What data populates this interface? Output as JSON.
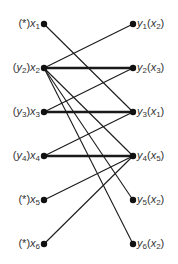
{
  "diagram": {
    "type": "bipartite-matching",
    "left_nodes": [
      {
        "id": "x1",
        "var": "x",
        "sub": "1",
        "label_prefix": "(*)",
        "match": null
      },
      {
        "id": "x2",
        "var": "x",
        "sub": "2",
        "label_prefix": "(y2)",
        "match": "y2"
      },
      {
        "id": "x3",
        "var": "x",
        "sub": "3",
        "label_prefix": "(y3)",
        "match": "y3"
      },
      {
        "id": "x4",
        "var": "x",
        "sub": "4",
        "label_prefix": "(y4)",
        "match": "y4"
      },
      {
        "id": "x5",
        "var": "x",
        "sub": "5",
        "label_prefix": "(*)",
        "match": null
      },
      {
        "id": "x6",
        "var": "x",
        "sub": "6",
        "label_prefix": "(*)",
        "match": null
      }
    ],
    "right_nodes": [
      {
        "id": "y1",
        "var": "y",
        "sub": "1",
        "label_suffix_var": "x",
        "label_suffix_sub": "2"
      },
      {
        "id": "y2",
        "var": "y",
        "sub": "2",
        "label_suffix_var": "x",
        "label_suffix_sub": "3"
      },
      {
        "id": "y3",
        "var": "y",
        "sub": "3",
        "label_suffix_var": "x",
        "label_suffix_sub": "1"
      },
      {
        "id": "y4",
        "var": "y",
        "sub": "4",
        "label_suffix_var": "x",
        "label_suffix_sub": "5"
      },
      {
        "id": "y5",
        "var": "y",
        "sub": "5",
        "label_suffix_var": "x",
        "label_suffix_sub": "2"
      },
      {
        "id": "y6",
        "var": "y",
        "sub": "6",
        "label_suffix_var": "x",
        "label_suffix_sub": "2"
      }
    ],
    "edges": [
      {
        "from": "x1",
        "to": "y3",
        "matched": false
      },
      {
        "from": "x2",
        "to": "y1",
        "matched": false
      },
      {
        "from": "x2",
        "to": "y2",
        "matched": true
      },
      {
        "from": "x2",
        "to": "y4",
        "matched": false
      },
      {
        "from": "x2",
        "to": "y5",
        "matched": false
      },
      {
        "from": "x2",
        "to": "y6",
        "matched": false
      },
      {
        "from": "x3",
        "to": "y2",
        "matched": false
      },
      {
        "from": "x3",
        "to": "y3",
        "matched": true
      },
      {
        "from": "x4",
        "to": "y3",
        "matched": false
      },
      {
        "from": "x4",
        "to": "y4",
        "matched": true
      },
      {
        "from": "x5",
        "to": "y4",
        "matched": false
      },
      {
        "from": "x6",
        "to": "y4",
        "matched": false
      }
    ],
    "colors": {
      "line": "#1a1a1a",
      "node": "#111111",
      "text": "#333333"
    }
  }
}
